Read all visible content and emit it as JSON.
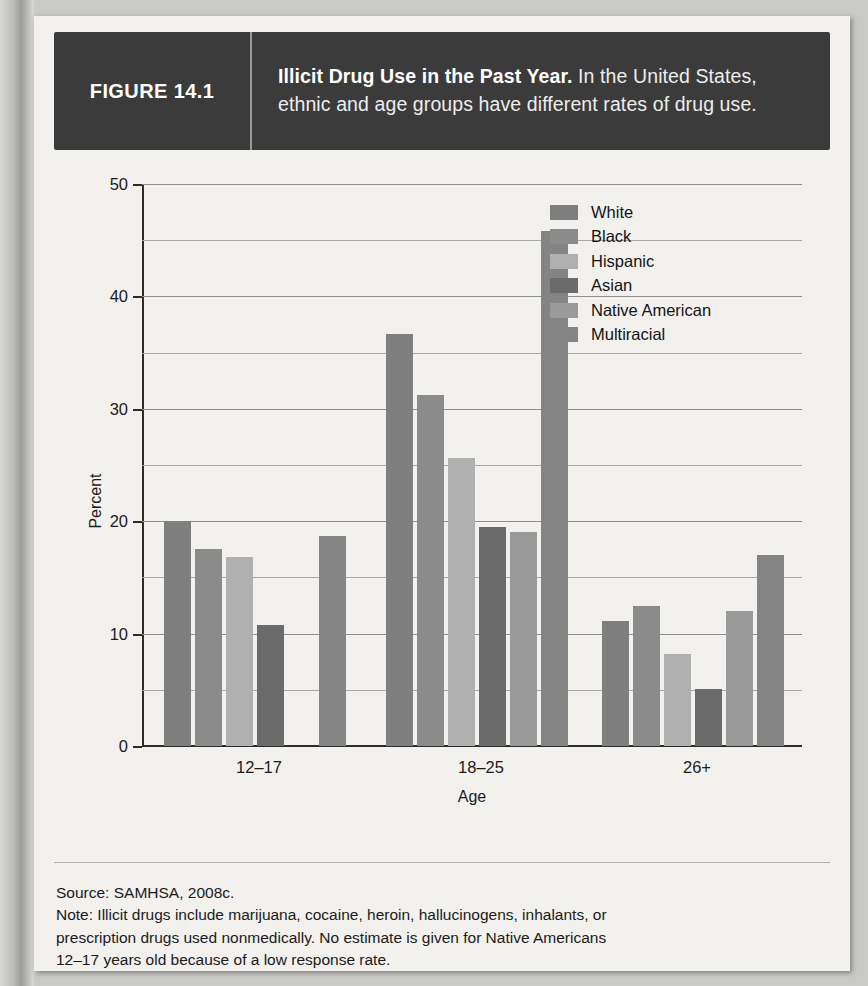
{
  "figure": {
    "number_label": "FIGURE 14.1",
    "caption_lead": "Illicit Drug Use in the Past Year.",
    "caption_rest": " In the United States, ethnic and age groups have different rates of drug use."
  },
  "footer": {
    "source": "Source: SAMHSA, 2008c.",
    "note_line1": "Note: Illicit drugs include marijuana, cocaine, heroin, hallucinogens, inhalants, or",
    "note_line2": "prescription drugs used nonmedically. No estimate is given for Native Americans",
    "note_line3": "12–17 years old because of a low response rate."
  },
  "chart_data": {
    "type": "bar",
    "title": "Illicit Drug Use in the Past Year",
    "xlabel": "Age",
    "ylabel": "Percent",
    "ylim": [
      0,
      50
    ],
    "ytick_labels": [
      "0",
      "10",
      "20",
      "30",
      "40",
      "50"
    ],
    "ytick_values": [
      0,
      10,
      20,
      30,
      40,
      50
    ],
    "minor_gridline_values": [
      5,
      15,
      25,
      35,
      45
    ],
    "grid": true,
    "legend_position": "upper right",
    "categories": [
      "12–17",
      "18–25",
      "26+"
    ],
    "series": [
      {
        "name": "White",
        "color": "#7f7f7f",
        "values": [
          20.0,
          36.7,
          11.1
        ]
      },
      {
        "name": "Black",
        "color": "#8b8b8b",
        "values": [
          17.5,
          31.2,
          12.5
        ]
      },
      {
        "name": "Hispanic",
        "color": "#b0b0b0",
        "values": [
          16.8,
          25.6,
          8.2
        ]
      },
      {
        "name": "Asian",
        "color": "#6b6b6b",
        "values": [
          10.8,
          19.5,
          5.1
        ]
      },
      {
        "name": "Native American",
        "color": "#9a9a9a",
        "values": [
          null,
          19.0,
          12.0
        ]
      },
      {
        "name": "Multiracial",
        "color": "#848484",
        "values": [
          18.7,
          45.8,
          17.0
        ]
      }
    ]
  },
  "colors": {
    "header_bar": "#3b3b3b",
    "page": "#f2f1ee",
    "axis": "#2c2c2c",
    "gridline": "#8e8e8e"
  }
}
